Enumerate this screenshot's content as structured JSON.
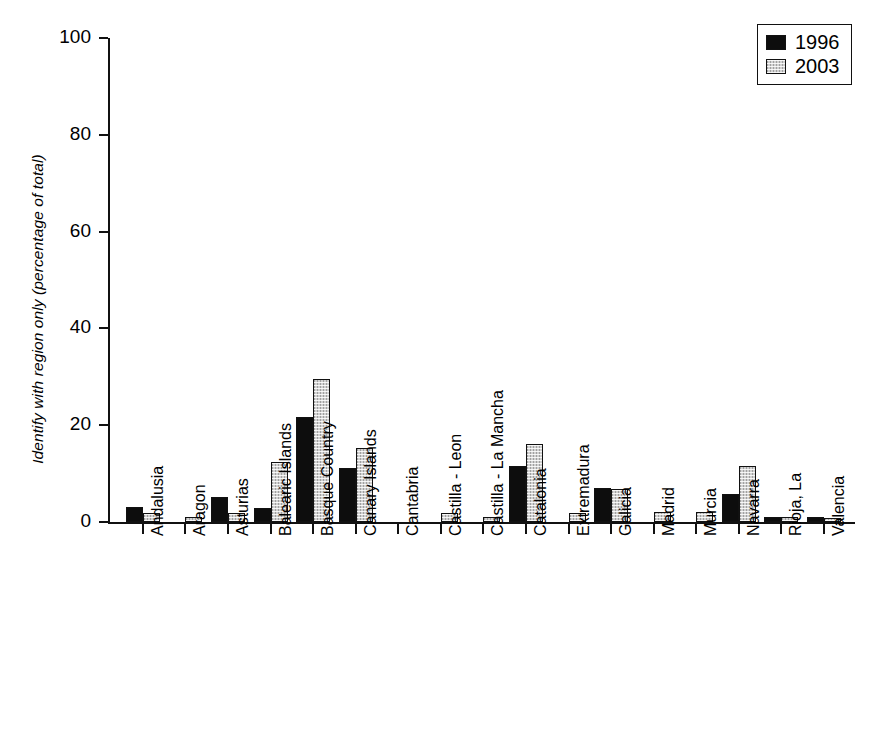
{
  "chart_data": {
    "type": "bar",
    "title": "",
    "xlabel": "",
    "ylabel": "Identify with region only (percentage of total)",
    "ylim": [
      0,
      100
    ],
    "yticks": [
      0,
      20,
      40,
      60,
      80,
      100
    ],
    "grid": false,
    "legend_position": "top-right",
    "categories": [
      "Andalusia",
      "Aragon",
      "Asturias",
      "Balearic Islands",
      "Basque Country",
      "Canary Islands",
      "Cantabria",
      "Castilla - Leon",
      "Castilla - La Mancha",
      "Catalonia",
      "Extremadura",
      "Galicia",
      "Madrid",
      "Murcia",
      "Navarra",
      "Rioja, La",
      "Valencia"
    ],
    "series": [
      {
        "name": "1996",
        "color": "#0d0d0d",
        "values": [
          3.0,
          0.0,
          5.2,
          2.9,
          21.6,
          11.2,
          0.0,
          0.0,
          0.0,
          11.5,
          0.0,
          7.1,
          0.0,
          0.0,
          5.7,
          1.0,
          1.0
        ]
      },
      {
        "name": "2003",
        "color": "#d2d2d2",
        "values": [
          1.9,
          1.0,
          1.9,
          12.3,
          29.5,
          15.3,
          0.0,
          1.9,
          1.0,
          16.1,
          1.9,
          6.9,
          2.1,
          2.0,
          11.6,
          1.0,
          0.9
        ]
      }
    ]
  },
  "legend": {
    "entries": [
      {
        "label": "1996"
      },
      {
        "label": "2003"
      }
    ]
  }
}
